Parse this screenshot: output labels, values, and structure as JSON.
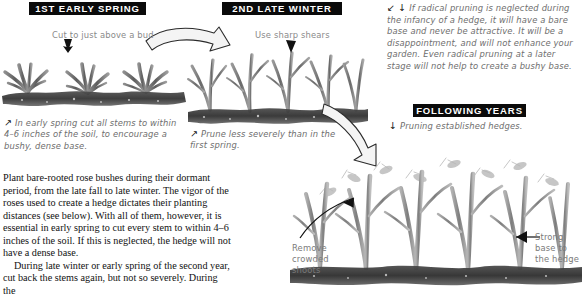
{
  "page": {
    "background": "#ffffff",
    "ink": "#111111",
    "annotation_color": "#6e6e6e",
    "header_bar_color": "#0a0a0a",
    "header_text_color": "#ffffff"
  },
  "headers": [
    {
      "id": "first-early-spring",
      "label": "1ST EARLY SPRING"
    },
    {
      "id": "second-late-winter",
      "label": "2ND LATE WINTER"
    },
    {
      "id": "following-years",
      "label": "FOLLOWING YEARS"
    }
  ],
  "labels": {
    "cut_above_bud": "Cut to just above a bud",
    "use_sharp_shears": "Use sharp shears",
    "remove_crowded_shoots": "Remove crowded shoots",
    "strong_base": "Strong base to the hedge"
  },
  "captions": {
    "panel1": {
      "marker": "↗",
      "text": "In early spring cut all stems to within 4–6 inches of the soil, to encourage a bushy, dense base."
    },
    "panel2": {
      "marker": "↗",
      "text": "Prune less severely than in the first spring."
    },
    "panel3": {
      "marker": "↓",
      "text": "Pruning established hedges."
    },
    "top_note": {
      "marker": "↙ ↓",
      "text": "If radical pruning is neglected during the infancy of a hedge, it will have a bare base and never be attractive. It will be a disappointment, and will not enhance your garden. Even radical pruning at a later stage will not help to create a bushy base."
    }
  },
  "body": {
    "paragraphs": [
      "Plant bare-rooted rose bushes during their dormant period, from the late fall to late winter. The vigor of the roses used to create a hedge dictates their planting distances (see below). With all of them, however, it is essential in early spring to cut every stem to within 4–6 inches of the soil. If this is neglected, the hedge will not have a dense base.",
      "During late winter or early spring of the second year, cut back the stems again, but not so severely. During the"
    ]
  },
  "icons": {
    "curved_arrow_right": "curved-arrow-right-icon",
    "curved_arrow_down": "curved-arrow-down-icon",
    "leader_arrow_remove": "leader-arrow-icon",
    "leader_arrow_strong": "leader-arrow-icon",
    "pointer_down": "pointer-down-icon"
  }
}
